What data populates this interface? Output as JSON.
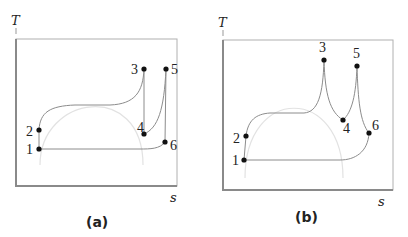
{
  "panels": [
    {
      "id": "a",
      "caption": "(a)",
      "y_axis_label": "T",
      "x_axis_label": "s",
      "points": [
        {
          "label": "1",
          "x": 39,
          "y": 149
        },
        {
          "label": "2",
          "x": 39,
          "y": 130
        },
        {
          "label": "3",
          "x": 144,
          "y": 69
        },
        {
          "label": "4",
          "x": 144,
          "y": 134
        },
        {
          "label": "5",
          "x": 166,
          "y": 69
        },
        {
          "label": "6",
          "x": 165,
          "y": 142
        }
      ]
    },
    {
      "id": "b",
      "caption": "(b)",
      "y_axis_label": "T",
      "x_axis_label": "s",
      "points": [
        {
          "label": "1",
          "x": 244,
          "y": 160
        },
        {
          "label": "2",
          "x": 246,
          "y": 136
        },
        {
          "label": "3",
          "x": 324,
          "y": 60
        },
        {
          "label": "4",
          "x": 343,
          "y": 120
        },
        {
          "label": "5",
          "x": 357,
          "y": 66
        },
        {
          "label": "6",
          "x": 369,
          "y": 133
        }
      ]
    }
  ],
  "colors": {
    "frame": "#9a9a9a",
    "process_line": "#8c8c8c",
    "dome": "#e2e2e2",
    "point": "#111111",
    "text": "#222222"
  }
}
